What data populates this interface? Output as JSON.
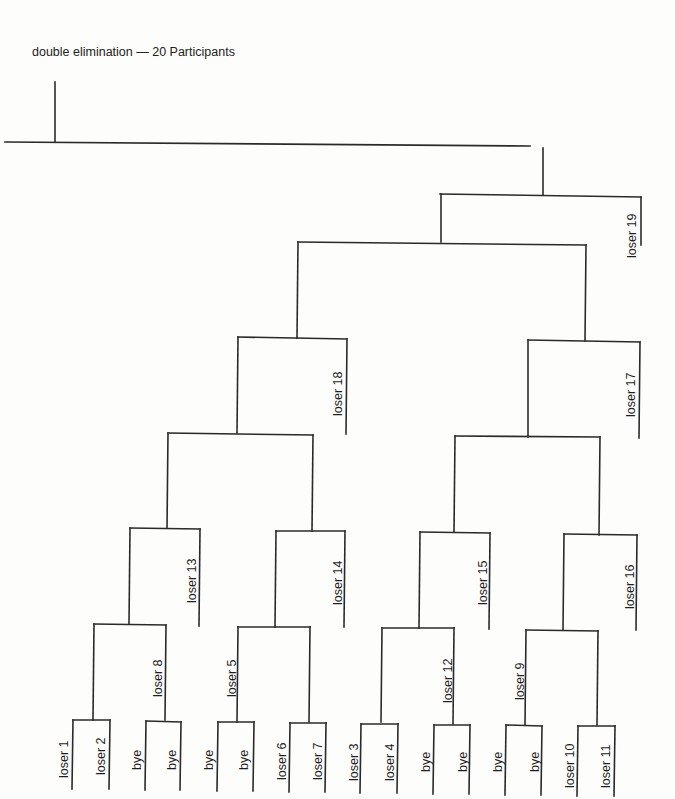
{
  "title": "double elimination — 20 Participants",
  "labels": {
    "loser_1": "loser 1",
    "loser_2": "loser 2",
    "loser_3": "loser 3",
    "loser_4": "loser 4",
    "loser_5": "loser 5",
    "loser_6": "loser 6",
    "loser_7": "loser 7",
    "loser_8": "loser 8",
    "loser_9": "loser 9",
    "loser_10": "loser 10",
    "loser_11": "loser 11",
    "loser_12": "loser 12",
    "loser_13": "loser 13",
    "loser_14": "loser 14",
    "loser_15": "loser 15",
    "loser_16": "loser 16",
    "loser_17": "loser 17",
    "loser_18": "loser 18",
    "loser_19": "loser 19",
    "bye": "bye"
  },
  "bottom_slots": [
    "loser 1",
    "loser 2",
    "bye",
    "bye",
    "bye",
    "bye",
    "loser 6",
    "loser 7",
    "loser 3",
    "loser 4",
    "bye",
    "bye",
    "bye",
    "bye",
    "loser 10",
    "loser 11"
  ],
  "colors": {
    "line": "#2a2a2a",
    "background": "#fdfdfb"
  }
}
